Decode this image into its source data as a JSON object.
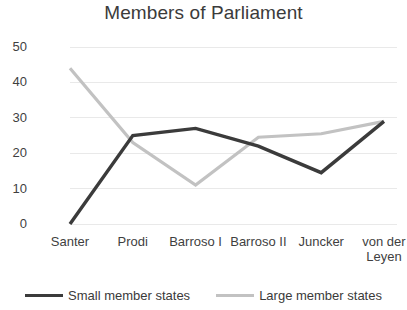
{
  "chart_data": {
    "type": "line",
    "title": "Members of Parliament",
    "xlabel": "",
    "ylabel": "",
    "ylim": [
      0,
      50
    ],
    "yticks": [
      "0",
      "10",
      "20",
      "30",
      "40",
      "50"
    ],
    "grid": true,
    "legend_position": "bottom",
    "categories": [
      "Santer",
      "Prodi",
      "Barroso I",
      "Barroso II",
      "Juncker",
      "von der Leyen"
    ],
    "series": [
      {
        "name": "Small member states",
        "color": "#3b3b3b",
        "values": [
          0,
          25,
          27,
          22,
          14.5,
          29
        ]
      },
      {
        "name": "Large member states",
        "color": "#c2c2c2",
        "values": [
          44,
          23,
          11,
          24.5,
          25.5,
          29
        ]
      }
    ]
  },
  "colors": {
    "small_member_states": "#3b3b3b",
    "large_member_states": "#c2c2c2",
    "gridline": "#e9e9e9",
    "text": "#3a3a3a",
    "background": "#ffffff"
  }
}
